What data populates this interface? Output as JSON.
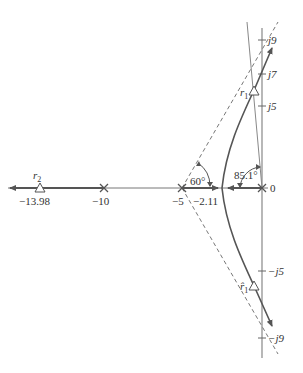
{
  "diagram": {
    "type": "root-locus",
    "colors": {
      "axis": "#777777",
      "locus": "#555555",
      "asymptote": "#666666",
      "text": "#333333",
      "background": "#ffffff"
    },
    "real_axis": {
      "poles": [
        {
          "value": 0,
          "label": "0"
        },
        {
          "value": -5,
          "label": "−5"
        },
        {
          "value": -10,
          "label": "−10"
        }
      ],
      "breakaway": {
        "value": -2.11,
        "label": "−2.11"
      },
      "root_r2": {
        "value": -13.98,
        "label": "−13.98",
        "name": "r",
        "subscript": "2"
      }
    },
    "imag_axis": {
      "ticks": [
        {
          "label": "j9"
        },
        {
          "label": "j7"
        },
        {
          "label": "j5"
        },
        {
          "label": "−j5"
        },
        {
          "label": "−j9"
        }
      ]
    },
    "roots": {
      "r1": {
        "name": "r",
        "subscript": "1"
      },
      "r1_conj": {
        "name": "r̂",
        "subscript": "1"
      }
    },
    "angles": {
      "asymptote_angle": "60°",
      "departure_angle": "85.1°"
    }
  }
}
